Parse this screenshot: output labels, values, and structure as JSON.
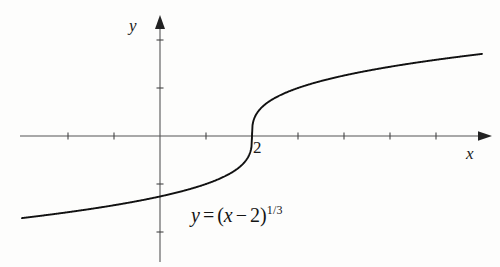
{
  "figure": {
    "kind": "math-function-graph",
    "background_color": "#fdfdfc",
    "ink_color": "#1a1a1a",
    "axis_color": "#555555",
    "curve_color": "#111111"
  },
  "axes": {
    "x_label": "x",
    "y_label": "y",
    "origin_px": [
      160,
      136
    ],
    "x_unit_px": 46,
    "y_unit_px": 48,
    "x_range": [
      -3.0,
      7.0
    ],
    "y_range": [
      -2.6,
      2.45
    ],
    "x_ticks": [
      -2,
      -1,
      1,
      2,
      3,
      4,
      5,
      6
    ],
    "y_ticks": [
      -2,
      -1,
      1,
      2
    ],
    "grid": false,
    "arrowheads": [
      "x-positive",
      "y-positive"
    ]
  },
  "annotations": {
    "x_intercept_label": "2",
    "equation": {
      "lhs": "y",
      "equals": "=",
      "open_paren": "(",
      "base_var": "x",
      "minus": "−",
      "constant": "2",
      "close_paren": ")",
      "exponent": "1/3",
      "plain": "y = (x − 2)^(1/3)"
    }
  },
  "chart_data": {
    "type": "line",
    "title": "",
    "xlabel": "x",
    "ylabel": "y",
    "xlim": [
      -3.0,
      7.0
    ],
    "ylim": [
      -2.6,
      2.45
    ],
    "grid": false,
    "legend": "none",
    "series": [
      {
        "name": "y = (x - 2)^(1/3)",
        "expression": "y = (x - 2)**(1/3)",
        "x": [
          -3.0,
          -2.5,
          -2.0,
          -1.5,
          -1.0,
          -0.5,
          0.0,
          0.5,
          1.0,
          1.25,
          1.5,
          1.75,
          1.9,
          1.97,
          2.0,
          2.03,
          2.1,
          2.25,
          2.5,
          3.0,
          3.5,
          4.0,
          4.5,
          5.0,
          5.5,
          6.0,
          6.5,
          7.0
        ],
        "y": [
          -1.71,
          -1.65,
          -1.587,
          -1.518,
          -1.442,
          -1.357,
          -1.26,
          -1.145,
          -1.0,
          -0.909,
          -0.794,
          -0.63,
          -0.464,
          -0.31,
          0.0,
          0.31,
          0.464,
          0.63,
          0.794,
          1.0,
          1.145,
          1.26,
          1.357,
          1.442,
          1.518,
          1.587,
          1.651,
          1.71
        ]
      }
    ],
    "annotations": [
      {
        "text": "2",
        "x": 2,
        "y": 0,
        "role": "x-intercept-tick-label"
      },
      {
        "text": "y = (x - 2)^(1/3)",
        "x": 1.2,
        "y": -1.75,
        "role": "equation-caption"
      }
    ]
  }
}
